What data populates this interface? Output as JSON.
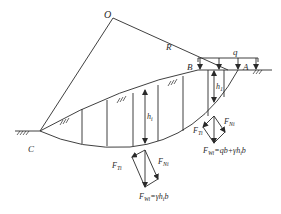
{
  "diagram": {
    "type": "slope stability slice method diagram",
    "points": {
      "O": "O",
      "R": "R",
      "B": "B",
      "A": "A",
      "C": "C",
      "q": "q"
    },
    "heights": {
      "h1": {
        "main": "h",
        "sub": "1"
      },
      "hi": {
        "main": "h",
        "sub": "i"
      }
    },
    "force_diagram_top": {
      "FTi": {
        "main": "F",
        "sub": "Ti"
      },
      "FNi": {
        "main": "F",
        "sub": "Ni"
      },
      "FWi": {
        "main": "F",
        "sub": "Wi",
        "rest": "=qb+γh",
        "sub2": "i",
        "tail": "b"
      }
    },
    "force_diagram_bottom": {
      "FTi": {
        "main": "F",
        "sub": "Ti"
      },
      "FNi": {
        "main": "F",
        "sub": "Ni"
      },
      "FWi": {
        "main": "F",
        "sub": "Wi",
        "rest": "=γh",
        "sub2": "i",
        "tail": "b"
      }
    },
    "colors": {
      "line": "#2a2a2a",
      "background": "#ffffff"
    }
  }
}
